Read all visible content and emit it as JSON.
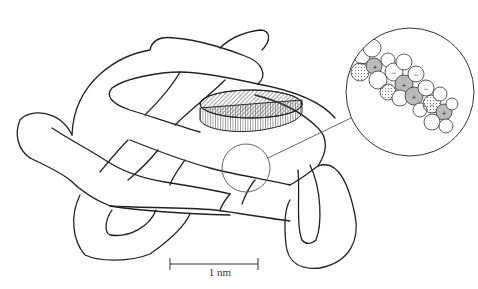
{
  "figure": {
    "scale_bar": {
      "label": "1 nm"
    },
    "inset": {
      "shape": "circle",
      "content": "space-filling atomic model with charge markers"
    },
    "charge_markers": [
      "+",
      "-",
      "+",
      "-",
      "+",
      "-",
      "+",
      "-"
    ],
    "colors": {
      "line": "#222222",
      "background": "#ffffff",
      "hatch": "#444444",
      "shade": "#bbbbbb"
    }
  }
}
